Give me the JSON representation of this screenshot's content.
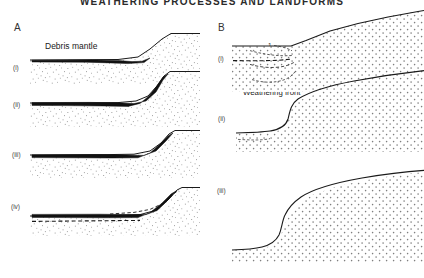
{
  "figure": {
    "title": "WEATHERING PROCESSES AND LANDFORMS",
    "panels": [
      {
        "letter": "A",
        "stages": [
          "(i)",
          "(ii)",
          "(iii)",
          "(iv)"
        ],
        "labels": [
          {
            "text": "Debris mantle"
          },
          {
            "text": "Weathered rock"
          },
          {
            "text": "Stream"
          }
        ]
      },
      {
        "letter": "B",
        "stages": [
          "(i)",
          "(ii)",
          "(iii)"
        ],
        "labels": [
          {
            "text": "Desiccated during"
          },
          {
            "text": "dry season"
          },
          {
            "text": "Weathering front"
          }
        ],
        "curve_numbers": [
          "1",
          "2",
          "3",
          "4"
        ]
      }
    ]
  },
  "colors": {
    "ink": "#1a1a1a",
    "debris_fill": "#111111",
    "stipple": "#8a8a8a",
    "background": "#ffffff"
  }
}
